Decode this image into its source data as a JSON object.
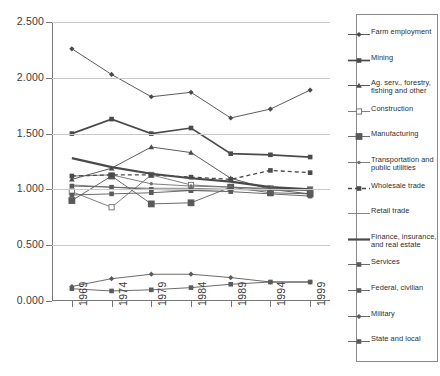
{
  "chart_data": {
    "type": "line",
    "title": "",
    "xlabel": "",
    "ylabel": "",
    "categories": [
      "1969",
      "1974",
      "1979",
      "1984",
      "1989",
      "1994",
      "1999"
    ],
    "ylim": [
      0.0,
      2.5
    ],
    "ytick_labels": [
      "0.000",
      "0.500",
      "1.000",
      "1.500",
      "2.000",
      "2.500"
    ],
    "ytick_values": [
      0.0,
      0.5,
      1.0,
      1.5,
      2.0,
      2.5
    ],
    "grid": true,
    "legend_position": "right",
    "series": [
      {
        "name": "Farm employment",
        "marker": "diamond",
        "line": "solid-thin",
        "color": "#4a4a4a",
        "values": [
          2.26,
          2.03,
          1.83,
          1.87,
          1.64,
          1.72,
          1.89
        ]
      },
      {
        "name": "Mining",
        "marker": "square",
        "line": "solid-medium",
        "color": "#4a4a4a",
        "values": [
          1.5,
          1.63,
          1.5,
          1.55,
          1.32,
          1.31,
          1.29
        ]
      },
      {
        "name": "Ag. serv., forestry, fishing and other",
        "marker": "triangle",
        "line": "solid-thin",
        "color": "#4a4a4a",
        "values": [
          1.09,
          1.19,
          1.38,
          1.33,
          1.1,
          1.0,
          0.96
        ]
      },
      {
        "name": "Construction",
        "marker": "open-square",
        "line": "solid-thin",
        "color": "#6f6f6f",
        "values": [
          0.98,
          0.84,
          1.13,
          1.04,
          1.02,
          1.01,
          1.0
        ]
      },
      {
        "name": "Manufacturing",
        "marker": "big-square",
        "line": "solid-thin",
        "color": "#5a5a5a",
        "values": [
          0.9,
          1.12,
          0.87,
          0.88,
          1.02,
          0.97,
          0.96
        ]
      },
      {
        "name": "Transportation and public utilities",
        "marker": "dot",
        "line": "solid-thin",
        "color": "#6f6f6f",
        "values": [
          1.12,
          1.13,
          1.05,
          1.03,
          1.02,
          1.0,
          0.99
        ]
      },
      {
        "name": "Wholesale trade",
        "marker": "square",
        "line": "dashed",
        "color": "#4a4a4a",
        "values": [
          1.12,
          1.13,
          1.13,
          1.11,
          1.09,
          1.17,
          1.15
        ]
      },
      {
        "name": "Retail trade",
        "marker": "none",
        "line": "solid-thin",
        "color": "#7a7a7a",
        "values": [
          1.04,
          1.02,
          1.01,
          1.01,
          1.0,
          0.99,
          0.99
        ]
      },
      {
        "name": "Finance, insurance, and real estate",
        "marker": "none",
        "line": "solid-thick",
        "color": "#4a4a4a",
        "values": [
          1.28,
          1.2,
          1.14,
          1.1,
          1.07,
          1.02,
          1.0
        ]
      },
      {
        "name": "Services",
        "marker": "square",
        "line": "solid-thin",
        "color": "#5a5a5a",
        "values": [
          0.95,
          0.96,
          0.97,
          0.99,
          1.0,
          1.0,
          1.0
        ]
      },
      {
        "name": "Federal, civilian",
        "marker": "square",
        "line": "solid-thin",
        "color": "#5a5a5a",
        "values": [
          1.03,
          1.02,
          1.0,
          0.99,
          0.98,
          0.96,
          0.94
        ]
      },
      {
        "name": "Military",
        "marker": "diamond",
        "line": "solid-thin",
        "color": "#5a5a5a",
        "values": [
          0.13,
          0.2,
          0.24,
          0.24,
          0.21,
          0.17,
          0.17
        ]
      },
      {
        "name": "State and local",
        "marker": "square",
        "line": "solid-thin",
        "color": "#5a5a5a",
        "values": [
          0.11,
          0.09,
          0.1,
          0.12,
          0.15,
          0.17,
          0.17
        ]
      }
    ]
  }
}
